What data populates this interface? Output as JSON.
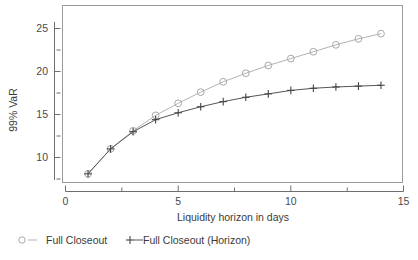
{
  "chart_data": {
    "type": "line",
    "title": "",
    "xlabel": "Liquidity horizon in days",
    "ylabel": "99% VaR",
    "xlim": [
      0,
      15
    ],
    "ylim": [
      7.2,
      26.4
    ],
    "grid": false,
    "legend_position": "below-left",
    "x_ticks_major": [
      0,
      5,
      10,
      15
    ],
    "x_ticks_minor": [
      2.5,
      7.5,
      12.5
    ],
    "y_ticks_major": [
      10,
      15,
      20,
      25
    ],
    "y_ticks_minor": [
      12.5,
      17.5,
      22.5,
      7.5,
      26
    ],
    "x": [
      1,
      2,
      3,
      4,
      5,
      6,
      7,
      8,
      9,
      10,
      11,
      12,
      13,
      14
    ],
    "series": [
      {
        "name": "Full Closeout",
        "marker": "circle",
        "color": "#a8a8a8",
        "values": [
          8.1,
          11.0,
          13.1,
          14.9,
          16.3,
          17.6,
          18.8,
          19.8,
          20.7,
          21.5,
          22.3,
          23.1,
          23.8,
          24.4
        ]
      },
      {
        "name": "Full Closeout (Horizon)",
        "marker": "plus",
        "color": "#444444",
        "values": [
          8.1,
          11.0,
          13.0,
          14.4,
          15.2,
          15.9,
          16.5,
          17.0,
          17.4,
          17.8,
          18.05,
          18.2,
          18.3,
          18.4
        ]
      }
    ]
  },
  "axis": {
    "x_labels": [
      "0",
      "5",
      "10",
      "15"
    ],
    "y_labels": [
      "10",
      "15",
      "20",
      "25"
    ],
    "x_title": "Liquidity horizon in days",
    "y_title": "99% VaR"
  },
  "legend": {
    "entries": [
      {
        "label": "Full Closeout",
        "marker_icon": "open-circle-marker"
      },
      {
        "label": "Full Closeout (Horizon)",
        "marker_icon": "plus-marker"
      }
    ]
  },
  "colors": {
    "series_a": "#a8a8a8",
    "series_b": "#444444",
    "frame": "#9a9a9a",
    "axis": "#6f6f6f",
    "background": "#ffffff"
  }
}
